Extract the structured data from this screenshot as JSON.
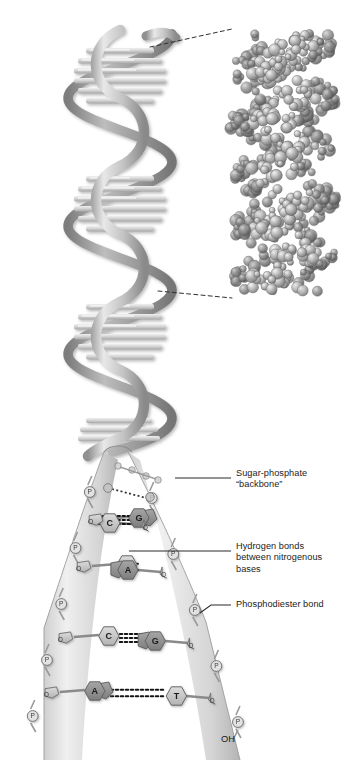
{
  "figure": {
    "background_color": "#ffffff"
  },
  "panels": {
    "helix": {
      "name": "ribbon-double-helix",
      "turns": 5
    },
    "space_filling": {
      "name": "space-filling-model"
    },
    "ladder": {
      "name": "unwound-base-pair-ladder"
    }
  },
  "labels": [
    {
      "id": "sugar-phosphate",
      "text": "Sugar-phosphate\n“backbone”",
      "x": 236,
      "y": 468
    },
    {
      "id": "hydrogen-bonds",
      "text": "Hydrogen bonds\nbetween nitrogenous\nbases",
      "x": 236,
      "y": 541
    },
    {
      "id": "phosphodiester",
      "text": "Phosphodiester bond",
      "x": 236,
      "y": 605
    }
  ],
  "terminal_label": {
    "text": "OH",
    "x": 221,
    "y": 733
  },
  "base_pairs": [
    {
      "left": "G",
      "right": "C",
      "bonds": 3,
      "y": 519,
      "highlight": false
    },
    {
      "left": "T",
      "right": "A",
      "bonds": 2,
      "y": 566,
      "highlight": true
    },
    {
      "left": "C",
      "right": "G",
      "bonds": 3,
      "y": 637,
      "highlight": false
    },
    {
      "left": "A",
      "right": "T",
      "bonds": 2,
      "y": 692,
      "highlight": false
    }
  ],
  "phosphate_symbol": "P",
  "colors": {
    "text": "#1b1b1b",
    "ribbon_light": "#d8d8d8",
    "ribbon_mid": "#b4b4b4",
    "ribbon_dark": "#8d8d8d",
    "base_light": "#c9c9c9",
    "base_dark": "#9a9a9a",
    "sugar": "#b0b0b0",
    "leader": "#2a2a2a",
    "bond": "#1f1f1f"
  }
}
